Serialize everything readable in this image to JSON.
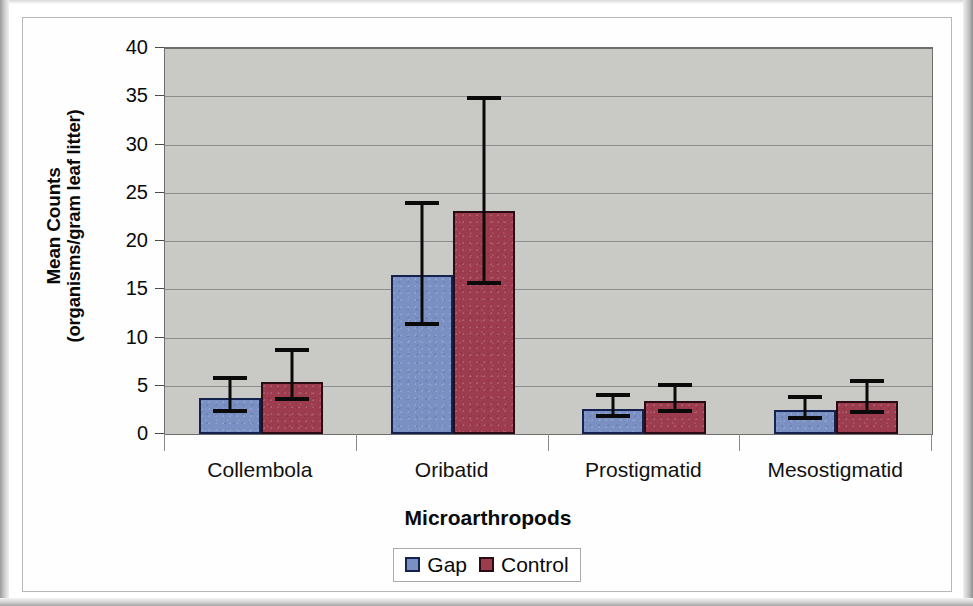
{
  "chart_data": {
    "type": "bar",
    "title": "",
    "xlabel": "Microarthropods",
    "ylabel_line1": "Mean Counts",
    "ylabel_line2": "(organisms/gram leaf litter)",
    "categories": [
      "Collembola",
      "Oribatid",
      "Prostigmatid",
      "Mesostigmatid"
    ],
    "series": [
      {
        "name": "Gap",
        "color": "#7a90c2",
        "border_color": "#16224e",
        "values": [
          3.7,
          16.5,
          2.6,
          2.5
        ],
        "error_low": [
          2.2,
          11.2,
          1.7,
          1.5
        ],
        "error_high": [
          6.0,
          24.1,
          4.2,
          4.0
        ]
      },
      {
        "name": "Control",
        "color": "#9c3c4e",
        "border_color": "#2a0d14",
        "values": [
          5.4,
          23.1,
          3.4,
          3.4
        ],
        "error_low": [
          3.4,
          15.4,
          2.2,
          2.1
        ],
        "error_high": [
          8.9,
          35.0,
          5.3,
          5.7
        ]
      }
    ],
    "ylim": [
      0,
      40
    ],
    "ytick_values": [
      0,
      5,
      10,
      15,
      20,
      25,
      30,
      35,
      40
    ],
    "ytick_labels": [
      "0",
      "5",
      "10",
      "15",
      "20",
      "25",
      "30",
      "35",
      "40"
    ],
    "grid": true,
    "legend_position": "bottom",
    "plot_background": "#c9c9c5",
    "error_bar_type": "error bars"
  },
  "legend": {
    "entries": [
      {
        "label": "Gap"
      },
      {
        "label": "Control"
      }
    ]
  }
}
